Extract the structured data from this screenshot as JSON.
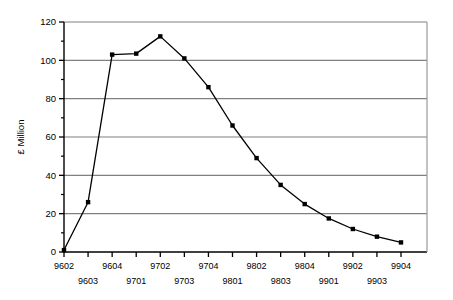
{
  "chart_data": {
    "type": "line",
    "title": "",
    "xlabel": "",
    "ylabel": "£ Million",
    "ylim": [
      0,
      120
    ],
    "ytick_labels": [
      "0",
      "20",
      "40",
      "60",
      "80",
      "100",
      "120"
    ],
    "ytick_values": [
      0,
      20,
      40,
      60,
      80,
      100,
      120
    ],
    "yminor_step": 10,
    "grid": "horizontal",
    "legend": "none",
    "marker": "filled-square",
    "categories": [
      "9602",
      "9603",
      "9604",
      "9701",
      "9702",
      "9703",
      "9704",
      "9801",
      "9802",
      "9803",
      "9804",
      "9901",
      "9902",
      "9903",
      "9904"
    ],
    "values": [
      1,
      26,
      103,
      103.5,
      112.5,
      101,
      86,
      66,
      49,
      35,
      25,
      17.5,
      12,
      8,
      5
    ],
    "series": [
      {
        "name": "",
        "values": [
          1,
          26,
          103,
          103.5,
          112.5,
          101,
          86,
          66,
          49,
          35,
          25,
          17.5,
          12,
          8,
          5
        ]
      }
    ],
    "xtick_labels_upper": [
      "9602",
      "",
      "9604",
      "",
      "9702",
      "",
      "9704",
      "",
      "9802",
      "",
      "9804",
      "",
      "9902",
      "",
      "9904"
    ],
    "xtick_labels_lower": [
      "",
      "9603",
      "",
      "9701",
      "",
      "9703",
      "",
      "9801",
      "",
      "9803",
      "",
      "9901",
      "",
      "9903",
      ""
    ],
    "colors": {
      "line": "#000000",
      "marker": "#000000",
      "grid": "#808080",
      "axis": "#000000",
      "background": "#ffffff"
    }
  }
}
